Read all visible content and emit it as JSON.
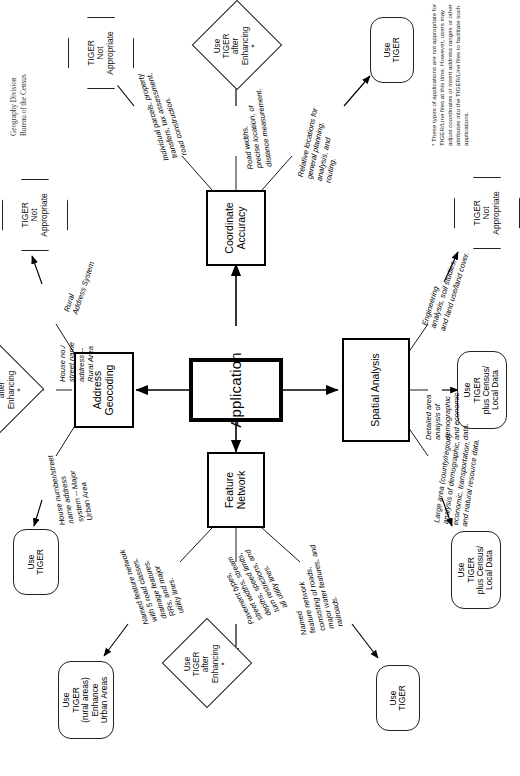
{
  "diagram": {
    "title": "Application",
    "credit": "Geography Division\nBureau of the Census",
    "footnote": "* These types of applications are not appropriate for TIGER/Line files at this time.  However, users may adjust coordinates or insert address ranges or other attributes into the TIGER/Line files to facilitate such applications.",
    "center_node": {
      "label": "Application"
    },
    "categories": [
      {
        "id": "feature-network",
        "label": "Feature\nNetwork"
      },
      {
        "id": "address-geocoding",
        "label": "Address\nGeocoding"
      },
      {
        "id": "coordinate-accuracy",
        "label": "Coordinate\nAccuracy"
      },
      {
        "id": "spatial-analysis",
        "label": "Spatial Analysis"
      }
    ],
    "edges": [
      {
        "id": "e1",
        "from": "feature-network",
        "to": "t-use-tiger-rural-urban",
        "label": "Named feature network\nwith 5 road classes,\ndrainage features,\nRRs, and major\nutility lines."
      },
      {
        "id": "e2",
        "from": "feature-network",
        "to": "t-use-tiger-after-enh-1",
        "label": "Pavement types,\nstreet widths, stream\ndepths, speed limits,\nturn restrictions, and\nall utility lines."
      },
      {
        "id": "e3",
        "from": "feature-network",
        "to": "t-use-tiger-1",
        "label": "Named\nfeature network\nconsisting of roads,\nmajor water features, and\nrailroads."
      },
      {
        "id": "e4",
        "from": "address-geocoding",
        "to": "t-use-tiger-2",
        "label": "House number/street\nname address\nsystem -- Major\nUrban Area"
      },
      {
        "id": "e5",
        "from": "address-geocoding",
        "to": "t-use-tiger-after-enh-2",
        "label": "House no./\nstreet name\naddress --\nRural Area"
      },
      {
        "id": "e6",
        "from": "address-geocoding",
        "to": "t-not-appropriate-1",
        "label": "Rural\nAddress System"
      },
      {
        "id": "e7",
        "from": "coordinate-accuracy",
        "to": "t-not-appropriate-2",
        "label": "Individual parcels, property\ntransfers, tax assessment,\nroad construction."
      },
      {
        "id": "e8",
        "from": "coordinate-accuracy",
        "to": "t-use-tiger-after-enh-3",
        "label": "Road widths,\nprecise location, or\ndistance measurement."
      },
      {
        "id": "e9",
        "from": "coordinate-accuracy",
        "to": "t-use-tiger-3",
        "label": "Relative locations for\ngeneral planning,\nanalysis, and\nrouting."
      },
      {
        "id": "e10",
        "from": "spatial-analysis",
        "to": "t-use-tiger-census-local-1",
        "label": "Large area (county/region)\nanalysis of demographic,\neconomic, transportation,\nand natural resource data."
      },
      {
        "id": "e11",
        "from": "spatial-analysis",
        "to": "t-use-tiger-census-local-2",
        "label": "Detailed area\nanalysis of\ndemographic\nand economic\ndata."
      },
      {
        "id": "e12",
        "from": "spatial-analysis",
        "to": "t-not-appropriate-3",
        "label": "Engineering\nanalysis, soil studies,\nand land use/land cover."
      }
    ],
    "terminals": [
      {
        "id": "t-use-tiger-rural-urban",
        "shape": "rounded",
        "label": "Use\nTIGER\n(rural areas)\nEnhance\nUrban Areas"
      },
      {
        "id": "t-use-tiger-after-enh-1",
        "shape": "diamond",
        "label": "Use\nTIGER\nafter\nEnhancing\n*"
      },
      {
        "id": "t-use-tiger-1",
        "shape": "rounded",
        "label": "Use\nTIGER"
      },
      {
        "id": "t-use-tiger-2",
        "shape": "rounded",
        "label": "Use\nTIGER"
      },
      {
        "id": "t-use-tiger-after-enh-2",
        "shape": "diamond",
        "label": "Use\nTIGER\nafter\nEnhancing\n*"
      },
      {
        "id": "t-not-appropriate-1",
        "shape": "octagon",
        "label": "TIGER\nNot\nAppropriate"
      },
      {
        "id": "t-not-appropriate-2",
        "shape": "octagon",
        "label": "TIGER\nNot\nAppropriate"
      },
      {
        "id": "t-use-tiger-after-enh-3",
        "shape": "diamond",
        "label": "Use\nTIGER\nafter\nEnhancing\n*"
      },
      {
        "id": "t-use-tiger-3",
        "shape": "rounded",
        "label": "Use\nTIGER"
      },
      {
        "id": "t-use-tiger-census-local-1",
        "shape": "rounded",
        "label": "Use\nTIGER\nplus Census/\nLocal Data"
      },
      {
        "id": "t-use-tiger-census-local-2",
        "shape": "rounded",
        "label": "Use\nTIGER\nplus Census/\nLocal Data"
      },
      {
        "id": "t-not-appropriate-3",
        "shape": "octagon",
        "label": "TIGER\nNot\nAppropriate"
      }
    ],
    "colors": {
      "ink": "#000000",
      "paper": "#ffffff",
      "muted": "#333333"
    }
  }
}
